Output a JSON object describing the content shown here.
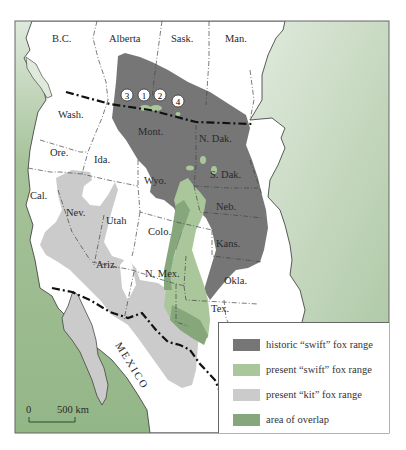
{
  "map": {
    "labels": {
      "bc": "B.C.",
      "alberta": "Alberta",
      "sask": "Sask.",
      "man": "Man.",
      "wash": "Wash.",
      "ore": "Ore.",
      "ida": "Ida.",
      "mont": "Mont.",
      "ndak": "N. Dak.",
      "sdak": "S. Dak.",
      "wyo": "Wyo.",
      "cal": "Cal.",
      "nev": "Nev.",
      "utah": "Utah",
      "colo": "Colo.",
      "neb": "Neb.",
      "kans": "Kans.",
      "ariz": "Ariz.",
      "nmex": "N. Mex.",
      "okla": "Okla.",
      "tex": "Tex.",
      "mexico": "MEXICO"
    },
    "markers": [
      "3",
      "1",
      "2",
      "4"
    ],
    "scale": {
      "start": "0",
      "end": "500 km"
    },
    "colors": {
      "ocean": "#9fbf93",
      "ocean_light": "#dfe9dc",
      "land": "#ffffff",
      "historic_swift": "#767676",
      "present_swift": "#a9c79b",
      "present_kit": "#cbcbcb",
      "overlap": "#86a77b"
    }
  },
  "legend": {
    "items": [
      {
        "label": "historic “swift” fox range",
        "color": "#767676"
      },
      {
        "label": "present “swift” fox range",
        "color": "#a9c79b"
      },
      {
        "label": "present “kit” fox range",
        "color": "#cbcbcb"
      },
      {
        "label": "area of overlap",
        "color": "#86a77b"
      }
    ]
  }
}
